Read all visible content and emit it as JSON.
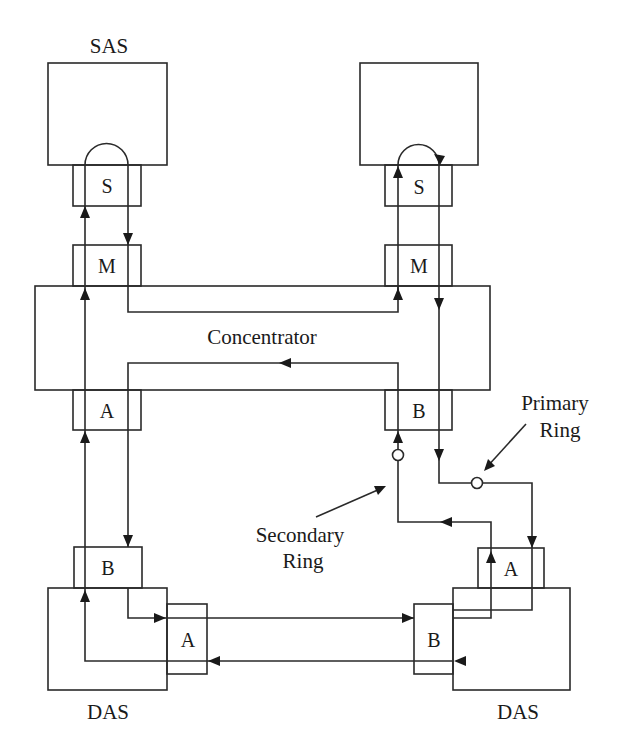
{
  "diagram": {
    "labels": {
      "sas_left": "SAS",
      "concentrator": "Concentrator",
      "das_left": "DAS",
      "das_right": "DAS",
      "primary_ring": [
        "Primary",
        "Ring"
      ],
      "secondary_ring": [
        "Secondary",
        "Ring"
      ]
    },
    "ports": {
      "sas_left_s": "S",
      "sas_left_m": "M",
      "sas_right_s": "S",
      "sas_right_m": "M",
      "conc_a": "A",
      "conc_b": "B",
      "das_left_b": "B",
      "das_left_a": "A",
      "das_right_a": "A",
      "das_right_b": "B"
    },
    "nodes": [
      {
        "id": "sas-left",
        "label": "SAS",
        "ports": [
          "S"
        ]
      },
      {
        "id": "sas-right",
        "label": "",
        "ports": [
          "S"
        ]
      },
      {
        "id": "concentrator",
        "label": "Concentrator",
        "ports": [
          "M",
          "M",
          "A",
          "B"
        ]
      },
      {
        "id": "das-left",
        "label": "DAS",
        "ports": [
          "B",
          "A"
        ]
      },
      {
        "id": "das-right",
        "label": "DAS",
        "ports": [
          "A",
          "B"
        ]
      }
    ],
    "colors": {
      "stroke": "#2a2a2a",
      "background": "#ffffff"
    }
  }
}
